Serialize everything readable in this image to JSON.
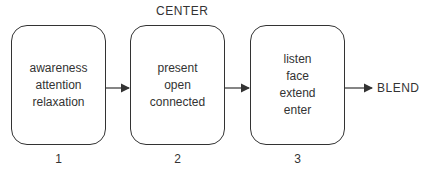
{
  "diagram": {
    "top_label": "CENTER",
    "output_label": "BLEND",
    "stages": [
      {
        "number": "1",
        "lines": [
          "awareness",
          "attention",
          "relaxation"
        ]
      },
      {
        "number": "2",
        "lines": [
          "present",
          "open",
          "connected"
        ]
      },
      {
        "number": "3",
        "lines": [
          "listen",
          "face",
          "extend",
          "enter"
        ]
      }
    ],
    "colors": {
      "stroke": "#333333",
      "text": "#333333",
      "background": "#ffffff"
    }
  }
}
